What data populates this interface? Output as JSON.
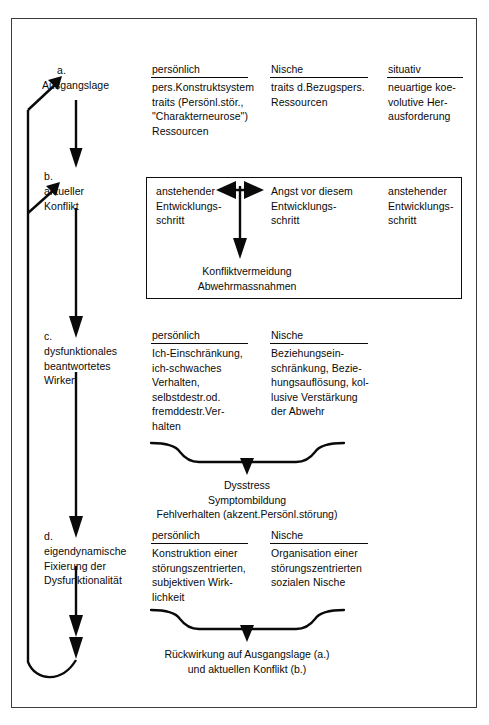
{
  "diagram": {
    "title_visible": false,
    "stages": [
      {
        "key": "a",
        "marker": "a.",
        "label": "Ausgangslage",
        "columns": [
          {
            "header": "persönlich",
            "lines": [
              "pers.Konstruktsystem",
              "traits (Persönl.stör.,",
              "\"Charakterneurose\")",
              "Ressourcen"
            ]
          },
          {
            "header": "Nische",
            "lines": [
              "traits d.Bezugspers.",
              "Ressourcen"
            ]
          },
          {
            "header": "situativ",
            "lines": [
              "neuartige koe-",
              "volutive Her-",
              "ausforderung"
            ]
          }
        ]
      },
      {
        "key": "b",
        "marker": "b.",
        "label": "aktueller\nKonflikt",
        "label_lines": [
          "aktueller",
          "Konflikt"
        ],
        "boxed": true,
        "columns": [
          {
            "header": "",
            "lines": [
              "anstehender",
              "Entwicklungs-",
              "schritt"
            ]
          },
          {
            "header": "",
            "lines": [
              "Angst vor diesem",
              "Entwicklungs-",
              "schritt"
            ]
          },
          {
            "header": "",
            "lines": [
              "anstehender",
              "Entwicklungs-",
              "schritt"
            ]
          }
        ],
        "outcome_lines": [
          "Konfliktvermeidung",
          "Abwehrmassnahmen"
        ]
      },
      {
        "key": "c",
        "marker": "c.",
        "label_lines": [
          "dysfunktionales",
          "beantwortetes",
          "Wirken"
        ],
        "columns": [
          {
            "header": "persönlich",
            "lines": [
              "Ich-Einschränkung,",
              "ich-schwaches",
              "Verhalten,",
              "selbstdestr.od.",
              "fremddestr.Ver-",
              "halten"
            ]
          },
          {
            "header": "Nische",
            "lines": [
              "Beziehungsein-",
              "schränkung, Bezie-",
              "hungsauflösung, kol-",
              "lusive Verstärkung",
              "der Abwehr"
            ]
          }
        ],
        "outcome_lines": [
          "Dysstress",
          "Symptombildung",
          "Fehlverhalten (akzent.Persönl.störung)"
        ]
      },
      {
        "key": "d",
        "marker": "d.",
        "label_lines": [
          "eigendynamische",
          "Fixierung der",
          "Dysfunktionalität"
        ],
        "columns": [
          {
            "header": "persönlich",
            "lines": [
              "Konstruktion einer",
              "störungszentrierten,",
              "subjektiven Wirk-",
              "lichkeit"
            ]
          },
          {
            "header": "Nische",
            "lines": [
              "Organisation einer",
              "störungszentrierten",
              "sozialen Nische"
            ]
          }
        ],
        "outcome_lines": [
          "Rückwirkung auf Ausgangslage (a.)",
          "und aktuellen Konflikt (b.)"
        ]
      }
    ],
    "connectors": {
      "feedback_to_a": "arrow-up-left-to-ausgangslage",
      "feedback_to_b": "arrow-up-left-to-konflikt",
      "horizontal_conflict": "double-headed-arrow",
      "vertical_main": "downward-flow-arrow"
    },
    "colors": {
      "ink": "#0a0a0a",
      "frame": "#3d3d3d",
      "background": "#ffffff"
    }
  }
}
